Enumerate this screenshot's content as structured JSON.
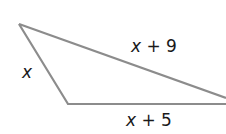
{
  "diagram": {
    "type": "triangle",
    "stroke_color": "#8c8c8c",
    "vertices": {
      "top_left": [
        19,
        24
      ],
      "bottom_left": [
        68,
        104
      ],
      "right": [
        226,
        98
      ]
    },
    "sides": [
      {
        "name": "left",
        "label_var": "x",
        "label_rest": ""
      },
      {
        "name": "top",
        "label_var": "x",
        "label_rest": " + 9"
      },
      {
        "name": "bottom",
        "label_var": "x",
        "label_rest": " + 5"
      }
    ]
  }
}
